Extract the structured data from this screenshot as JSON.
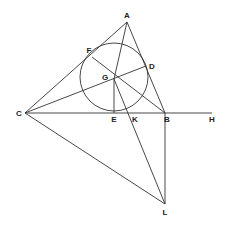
{
  "diagram": {
    "type": "geometry-figure",
    "stroke_color": "#333333",
    "circle": {
      "center": "G",
      "cx": 114,
      "cy": 77,
      "r": 34
    },
    "points": {
      "A": {
        "label": "A",
        "x": 127,
        "y": 22,
        "lx": 127,
        "ly": 18
      },
      "B": {
        "label": "B",
        "x": 165,
        "y": 113,
        "lx": 167,
        "ly": 122
      },
      "C": {
        "label": "C",
        "x": 25,
        "y": 113,
        "lx": 19,
        "ly": 116
      },
      "D": {
        "label": "D",
        "x": 146,
        "y": 66,
        "lx": 152,
        "ly": 69
      },
      "E": {
        "label": "E",
        "x": 114,
        "y": 113,
        "lx": 114,
        "ly": 122
      },
      "F": {
        "label": "F",
        "x": 92,
        "y": 57,
        "lx": 89,
        "ly": 53
      },
      "G": {
        "label": "G",
        "x": 114,
        "y": 79,
        "lx": 105,
        "ly": 80
      },
      "H": {
        "label": "H",
        "x": 212,
        "y": 113,
        "lx": 212,
        "ly": 122
      },
      "K": {
        "label": "K",
        "x": 133,
        "y": 113,
        "lx": 135,
        "ly": 122
      },
      "L": {
        "label": "L",
        "x": 165,
        "y": 204,
        "lx": 165,
        "ly": 215
      }
    },
    "segments": [
      [
        "C",
        "A"
      ],
      [
        "A",
        "B"
      ],
      [
        "C",
        "H"
      ],
      [
        "C",
        "D"
      ],
      [
        "A",
        "G"
      ],
      [
        "F",
        "B"
      ],
      [
        "G",
        "E"
      ],
      [
        "G",
        "L"
      ],
      [
        "C",
        "L"
      ],
      [
        "B",
        "L"
      ]
    ]
  }
}
